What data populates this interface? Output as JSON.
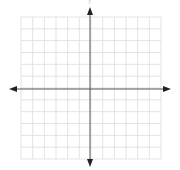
{
  "diagram": {
    "type": "coordinate-plane",
    "y_axis_label": "y",
    "grid": {
      "columns": 12,
      "rows": 12,
      "left": 21,
      "top": 17,
      "right": 161,
      "bottom": 159,
      "color": "#dcdcdc"
    },
    "axes": {
      "origin_x": 90,
      "origin_y": 89,
      "color": "#555555"
    },
    "arrows": {
      "left_x": 9,
      "right_x": 171,
      "top_y": 7,
      "bottom_y": 167,
      "color": "#222222"
    }
  }
}
